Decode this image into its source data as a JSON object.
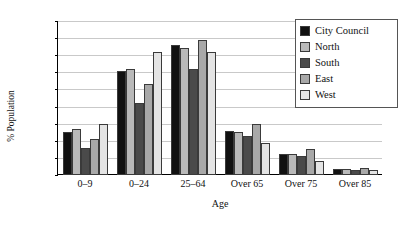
{
  "chart_data": {
    "type": "bar",
    "title": "",
    "xlabel": "Age",
    "ylabel": "% Population",
    "categories": [
      "0–9",
      "0–24",
      "25–64",
      "Over 65",
      "Over 75",
      "Over 85"
    ],
    "ylim": [
      0,
      45
    ],
    "yticks": [
      0,
      5,
      10,
      15,
      20,
      25,
      30,
      35,
      40,
      45
    ],
    "grid": true,
    "legend_position": "top-right",
    "series": [
      {
        "name": "City Council",
        "color": "#111111",
        "values": [
          12.5,
          30.5,
          38.0,
          13.0,
          6.0,
          1.8
        ]
      },
      {
        "name": "North",
        "color": "#b9b9b9",
        "values": [
          13.5,
          31.0,
          37.0,
          12.5,
          6.0,
          1.8
        ]
      },
      {
        "name": "South",
        "color": "#4a4a4a",
        "values": [
          8.0,
          21.0,
          31.0,
          11.5,
          5.5,
          1.6
        ]
      },
      {
        "name": "East",
        "color": "#a8a8a8",
        "values": [
          10.5,
          26.5,
          39.5,
          15.0,
          7.5,
          2.0
        ]
      },
      {
        "name": "West",
        "color": "#e4e4e4",
        "values": [
          15.0,
          36.0,
          36.0,
          9.5,
          4.0,
          1.5
        ]
      }
    ]
  }
}
